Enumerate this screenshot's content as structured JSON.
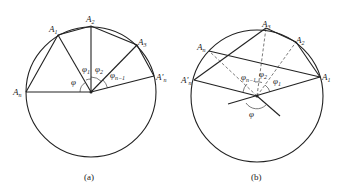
{
  "figure_a": {
    "caption": "(a)",
    "labels": {
      "An": "A",
      "An_sub": "n",
      "A1": "A",
      "A1_sub": "1",
      "A2": "A",
      "A2_sub": "2",
      "A3": "A",
      "A3_sub": "3",
      "Anp": "A'",
      "Anp_sub": "n",
      "phi": "φ",
      "phi1": "φ",
      "phi1_sub": "1",
      "phi2": "φ",
      "phi2_sub": "2",
      "phin1": "φ",
      "phin1_sub": "n−1"
    }
  },
  "figure_b": {
    "caption": "(b)",
    "labels": {
      "An": "A",
      "An_sub": "n",
      "Anp": "A'",
      "Anp_sub": "n",
      "A1": "A",
      "A1_sub": "1",
      "A2": "A",
      "A2_sub": "2",
      "A3": "A",
      "A3_sub": "3",
      "phi": "φ",
      "phi1": "φ",
      "phi1_sub": "1",
      "phi2": "φ",
      "phi2_sub": "2",
      "phin1": "φ",
      "phin1_sub": "n−1"
    }
  }
}
